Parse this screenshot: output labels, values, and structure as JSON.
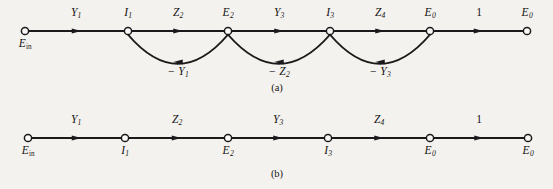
{
  "figure": {
    "background_color": "#f4f2ee",
    "ink_color": "#1a1a1a",
    "width": 553,
    "height": 189
  },
  "graph_a": {
    "caption": "(a)",
    "caption_x": 277,
    "caption_y": 82,
    "baseline_y": 31,
    "nodes": [
      {
        "id": "n0",
        "label_html": "E<sub>in</sub>",
        "label_style": "roman-sub",
        "x": 25,
        "label_pos": "below"
      },
      {
        "id": "n1",
        "label_html": "I<sub>1</sub>",
        "label_style": "italic-sub",
        "x": 128,
        "label_pos": "above"
      },
      {
        "id": "n2",
        "label_html": "E<sub>2</sub>",
        "label_style": "italic-sub",
        "x": 228,
        "label_pos": "above"
      },
      {
        "id": "n3",
        "label_html": "I<sub>3</sub>",
        "label_style": "italic-sub",
        "x": 330,
        "label_pos": "above"
      },
      {
        "id": "n4",
        "label_html": "E<sub>0</sub>",
        "label_style": "italic-sub",
        "x": 430,
        "label_pos": "above"
      },
      {
        "id": "n5",
        "label_html": "E<sub>0</sub>",
        "label_style": "italic-sub",
        "x": 527,
        "label_pos": "above"
      }
    ],
    "forward_edges": [
      {
        "from": "n0",
        "to": "n1",
        "label_html": "Y<sub>1</sub>",
        "label_x": 76,
        "plain": false
      },
      {
        "from": "n1",
        "to": "n2",
        "label_html": "Z<sub>2</sub>",
        "label_x": 178,
        "plain": false
      },
      {
        "from": "n2",
        "to": "n3",
        "label_html": "Y<sub>3</sub>",
        "label_x": 279,
        "plain": false
      },
      {
        "from": "n3",
        "to": "n4",
        "label_html": "Z<sub>4</sub>",
        "label_x": 380,
        "plain": false
      },
      {
        "from": "n4",
        "to": "n5",
        "label_html": "1",
        "label_x": 479,
        "plain": true
      }
    ],
    "feedback_edges": [
      {
        "from": "n2",
        "to": "n1",
        "label_html": "− Y<sub>1</sub>",
        "label_x": 178,
        "dip_y": 62
      },
      {
        "from": "n3",
        "to": "n2",
        "label_html": "− Z<sub>2</sub>",
        "label_x": 279,
        "dip_y": 62
      },
      {
        "from": "n4",
        "to": "n3",
        "label_html": "− Y<sub>3</sub>",
        "label_x": 380,
        "dip_y": 62
      }
    ]
  },
  "graph_b": {
    "caption": "(b)",
    "caption_x": 277,
    "caption_y": 168,
    "baseline_y": 138,
    "nodes": [
      {
        "id": "m0",
        "label_html": "E<sub>in</sub>",
        "label_style": "roman-sub",
        "x": 28,
        "label_pos": "below"
      },
      {
        "id": "m1",
        "label_html": "I<sub>1</sub>",
        "label_style": "italic-sub",
        "x": 125,
        "label_pos": "below"
      },
      {
        "id": "m2",
        "label_html": "E<sub>2</sub>",
        "label_style": "italic-sub",
        "x": 228,
        "label_pos": "below"
      },
      {
        "id": "m3",
        "label_html": "I<sub>3</sub>",
        "label_style": "italic-sub",
        "x": 328,
        "label_pos": "below"
      },
      {
        "id": "m4",
        "label_html": "E<sub>0</sub>",
        "label_style": "italic-sub",
        "x": 430,
        "label_pos": "below"
      },
      {
        "id": "m5",
        "label_html": "E<sub>0</sub>",
        "label_style": "italic-sub",
        "x": 528,
        "label_pos": "below"
      }
    ],
    "forward_edges": [
      {
        "from": "m0",
        "to": "m1",
        "label_html": "Y<sub>1</sub>",
        "label_x": 76,
        "plain": false
      },
      {
        "from": "m1",
        "to": "m2",
        "label_html": "Z<sub>2</sub>",
        "label_x": 177,
        "plain": false
      },
      {
        "from": "m2",
        "to": "m3",
        "label_html": "Y<sub>3</sub>",
        "label_x": 278,
        "plain": false
      },
      {
        "from": "m3",
        "to": "m4",
        "label_html": "Z<sub>4</sub>",
        "label_x": 379,
        "plain": false
      },
      {
        "from": "m4",
        "to": "m5",
        "label_html": "1",
        "label_x": 479,
        "plain": true
      }
    ],
    "feedback_edges": []
  }
}
